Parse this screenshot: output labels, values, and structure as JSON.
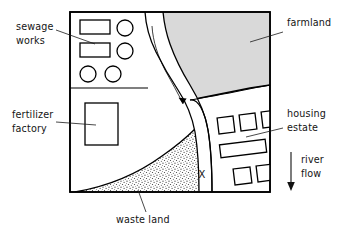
{
  "figure": {
    "labels": {
      "sewage_works": {
        "line1": "sewage",
        "line2": "works"
      },
      "fertilizer_factory": {
        "line1": "fertilizer",
        "line2": "factory"
      },
      "waste_land": {
        "line1": "waste land"
      },
      "farmland": {
        "line1": "farmland"
      },
      "housing_estate": {
        "line1": "housing",
        "line2": "estate"
      },
      "river_flow": {
        "line1": "river",
        "line2": "flow"
      },
      "sample_point": {
        "line1": "X"
      }
    },
    "colors": {
      "farmland_fill": "#d9d9d9",
      "waste_land_stipple": "#333333",
      "outline": "#000000",
      "page_background": "#ffffff",
      "label_text": "#141414"
    },
    "regions": [
      {
        "name": "sewage works",
        "fill": "white",
        "features": "two rectangular tanks, four circular tanks"
      },
      {
        "name": "fertilizer factory",
        "fill": "white",
        "features": "one large rectangular building"
      },
      {
        "name": "waste land",
        "fill": "stipple",
        "features": "dotted texture, curved upper boundary"
      },
      {
        "name": "farmland",
        "fill": "grey shading",
        "features": "shaded field east of river"
      },
      {
        "name": "housing estate",
        "fill": "white",
        "features": "six rectangular blocks in rows"
      },
      {
        "name": "river",
        "fill": "white channel",
        "features": "winding channel flowing north to south"
      }
    ],
    "icons": {
      "flow_arrow": "down-arrow-icon"
    }
  }
}
